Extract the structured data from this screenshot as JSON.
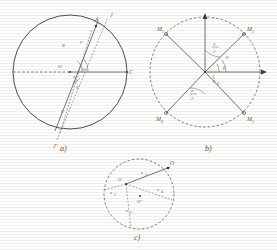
{
  "figure": {
    "type": "technical-geometry-diagram",
    "panels": [
      {
        "caption": "a)",
        "shape": "circle",
        "labels": {
          "point_a": "A",
          "point_c": "C",
          "center": "O",
          "center_prime": "O'",
          "center_dprime": "O\"",
          "radius": "R",
          "ray_upper": "J",
          "ray_lower": "J'",
          "angle_alpha": "α",
          "angle_small_1": "θ'",
          "angle_small_2": "θ\"",
          "angle_small_3": "θ",
          "radius_prime": "R'"
        }
      },
      {
        "caption": "b)",
        "shape": "dashed-circle",
        "labels": {
          "m1": "M",
          "m1_sub": "1",
          "m2": "M",
          "m2_sub": "2",
          "m3": "M",
          "m3_sub": "3",
          "m4": "M",
          "m4_sub": "4",
          "angle_half_upper": "a",
          "angle_half_upper_den": "2",
          "angle_half_lower": "a",
          "angle_half_lower_den": "2",
          "theta": "θ",
          "theta_zero": "θ",
          "theta_zero_sub": "0",
          "beta": "β"
        }
      },
      {
        "caption": "c)",
        "shape": "dashed-circle",
        "labels": {
          "point_o": "O",
          "center_prime": "O'",
          "center_dprime": "O\"",
          "e1": "e",
          "e1_sub": "1",
          "e2": "e",
          "e2_sub": "2",
          "e3": "e",
          "e3_sub": "3",
          "e4": "e",
          "e4_sub": "4"
        }
      }
    ]
  }
}
